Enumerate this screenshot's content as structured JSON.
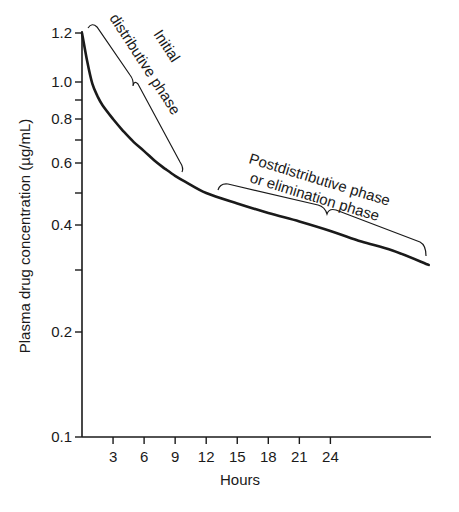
{
  "chart_data": {
    "type": "line",
    "title": "",
    "xlabel": "Hours",
    "ylabel": "Plasma drug concentration (µg/mL)",
    "yscale": "log",
    "xlim": [
      0,
      34
    ],
    "ylim": [
      0.1,
      1.2
    ],
    "grid": false,
    "legend": null,
    "x_ticks": [
      3,
      6,
      9,
      12,
      15,
      18,
      21,
      24
    ],
    "y_ticks": [
      {
        "value": 1.2,
        "label": "1.2"
      },
      {
        "value": 1.0,
        "label": "1.0"
      },
      {
        "value": 0.9,
        "label": ""
      },
      {
        "value": 0.8,
        "label": "0.8"
      },
      {
        "value": 0.7,
        "label": ""
      },
      {
        "value": 0.6,
        "label": "0.6"
      },
      {
        "value": 0.5,
        "label": ""
      },
      {
        "value": 0.4,
        "label": "0.4"
      },
      {
        "value": 0.3,
        "label": ""
      },
      {
        "value": 0.2,
        "label": "0.2"
      },
      {
        "value": 0.1,
        "label": "0.1"
      }
    ],
    "series": [
      {
        "name": "Plasma concentration",
        "x": [
          0,
          0.5,
          1,
          1.5,
          2,
          3,
          4,
          5,
          6,
          7,
          8,
          9,
          10,
          12,
          15,
          18,
          21,
          24,
          27,
          30,
          33.5
        ],
        "y": [
          1.2,
          1.08,
          0.99,
          0.92,
          0.87,
          0.8,
          0.74,
          0.69,
          0.65,
          0.61,
          0.58,
          0.555,
          0.535,
          0.5,
          0.465,
          0.435,
          0.41,
          0.385,
          0.36,
          0.34,
          0.31
        ]
      }
    ],
    "annotations": [
      {
        "text_lines": [
          "Initial",
          "distributive phase"
        ],
        "bracket_x_range": [
          1,
          9.5
        ],
        "note": "initial distributive phase"
      },
      {
        "text_lines": [
          "Postdistributive phase",
          "or elimination phase"
        ],
        "bracket_x_range": [
          13,
          33.5
        ],
        "note": "elimination phase"
      }
    ]
  },
  "axes": {
    "x_title": "Hours",
    "y_title": "Plasma drug concentration (µg/mL)"
  },
  "annotations": {
    "initial_line1": "Initial",
    "initial_line2": "distributive phase",
    "post_line1": "Postdistributive phase",
    "post_line2": "or elimination phase"
  },
  "colors": {
    "ink": "#1a1a1a",
    "background": "#ffffff"
  }
}
